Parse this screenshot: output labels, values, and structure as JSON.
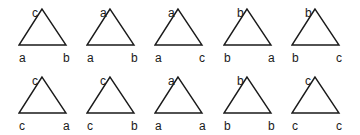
{
  "diagram": {
    "stroke_color": "#1a1a1a",
    "rows": [
      {
        "triangles": [
          {
            "apex": "c",
            "bottom_left": "a",
            "bottom_right": "b"
          },
          {
            "apex": "a",
            "bottom_left": "a",
            "bottom_right": "b"
          },
          {
            "apex": "a",
            "bottom_left": "a",
            "bottom_right": "c"
          },
          {
            "apex": "b",
            "bottom_left": "b",
            "bottom_right": "a"
          },
          {
            "apex": "b",
            "bottom_left": "b",
            "bottom_right": "c"
          }
        ]
      },
      {
        "triangles": [
          {
            "apex": "c",
            "bottom_left": "c",
            "bottom_right": "a"
          },
          {
            "apex": "c",
            "bottom_left": "c",
            "bottom_right": "b"
          },
          {
            "apex": "a",
            "bottom_left": "a",
            "bottom_right": "a"
          },
          {
            "apex": "b",
            "bottom_left": "b",
            "bottom_right": "b"
          },
          {
            "apex": "c",
            "bottom_left": "c",
            "bottom_right": "c"
          }
        ]
      }
    ]
  }
}
